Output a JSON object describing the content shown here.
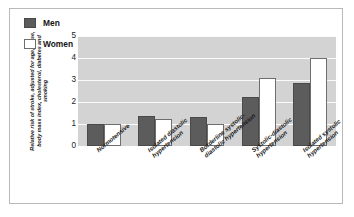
{
  "chart_data": {
    "type": "bar",
    "title": "",
    "xlabel": "",
    "ylabel": "Relative risk of stroke, adjusted for age, pulse, body mass index, cholesterol, diabetes and smoking",
    "ylim": [
      0,
      5
    ],
    "yticks": [
      "0",
      "1",
      "2",
      "3",
      "4",
      "5"
    ],
    "grid": true,
    "legend_position": "top-left",
    "categories": [
      "Normotensive",
      "Isolated diastolic hypertension",
      "Borderline systolic-diastolic hypertension",
      "Systolic-diastolic hypertension",
      "Isolated systolic hypertension"
    ],
    "series": [
      {
        "name": "Men",
        "color": "#5c5c5c",
        "values": [
          1.0,
          1.35,
          1.32,
          2.25,
          2.85
        ]
      },
      {
        "name": "Women",
        "color": "#ffffff",
        "values": [
          1.0,
          1.22,
          1.0,
          3.1,
          4.0
        ]
      }
    ]
  },
  "legend": {
    "items": [
      {
        "label": "Men"
      },
      {
        "label": "Women"
      }
    ]
  }
}
